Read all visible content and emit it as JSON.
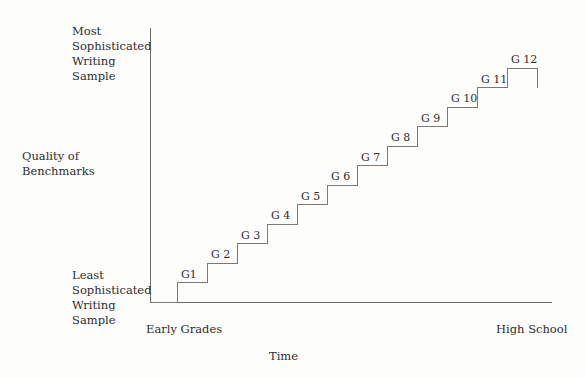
{
  "chart_data": {
    "type": "line",
    "title": "",
    "subtitle": "",
    "xlabel": "Time",
    "ylabel": "Quality of\nBenchmarks",
    "x_axis": {
      "left_label": "Early Grades",
      "right_label": "High School",
      "range_start": 0,
      "range_end": 12
    },
    "y_axis": {
      "top_label": "Most\nSophisticated\nWriting Sample",
      "bottom_label": "Least\nSophisticated\nWriting Sample",
      "range_start": 0,
      "range_end": 12
    },
    "grid": false,
    "legend": null,
    "shape": "staircase",
    "categories": [
      "G1",
      "G 2",
      "G 3",
      "G 4",
      "G 5",
      "G 6",
      "G 7",
      "G 8",
      "G 9",
      "G 10",
      "G 11",
      "G 12"
    ],
    "values": [
      1,
      2,
      3,
      4,
      5,
      6,
      7,
      8,
      9,
      10,
      11,
      12
    ],
    "annotations": [
      {
        "label": "G1",
        "step": 1
      },
      {
        "label": "G 2",
        "step": 2
      },
      {
        "label": "G 3",
        "step": 3
      },
      {
        "label": "G 4",
        "step": 4
      },
      {
        "label": "G 5",
        "step": 5
      },
      {
        "label": "G 6",
        "step": 6
      },
      {
        "label": "G 7",
        "step": 7
      },
      {
        "label": "G 8",
        "step": 8
      },
      {
        "label": "G 9",
        "step": 9
      },
      {
        "label": "G 10",
        "step": 10
      },
      {
        "label": "G 11",
        "step": 11
      },
      {
        "label": "G 12",
        "step": 12
      }
    ]
  },
  "colors": {
    "background": "#fdfdfc",
    "axis": "#6b6b6b",
    "step_line": "#7a7a7a",
    "text": "#2e2e2e"
  }
}
